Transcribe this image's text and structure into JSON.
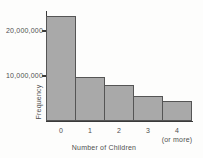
{
  "colors": {
    "background": "#fdfdfc",
    "bar_fill": "#a9a9a9",
    "bar_border": "#555555",
    "axis": "#3a3a3a",
    "text": "#4f4f4f"
  },
  "chart_data": {
    "type": "bar",
    "title": "",
    "xlabel": "Number of Children",
    "ylabel": "Frequency",
    "categories": [
      "0",
      "1",
      "2",
      "3",
      "4"
    ],
    "category_note": "(or more)",
    "note_category_index": 4,
    "values": [
      23300000,
      9800000,
      8000000,
      5600000,
      4400000
    ],
    "ylim": [
      0,
      24000000
    ],
    "yticks": [
      {
        "value": 20000000,
        "label": "20,000,000"
      },
      {
        "value": 10000000,
        "label": "10,000,000"
      }
    ],
    "grid": false,
    "legend": null
  }
}
